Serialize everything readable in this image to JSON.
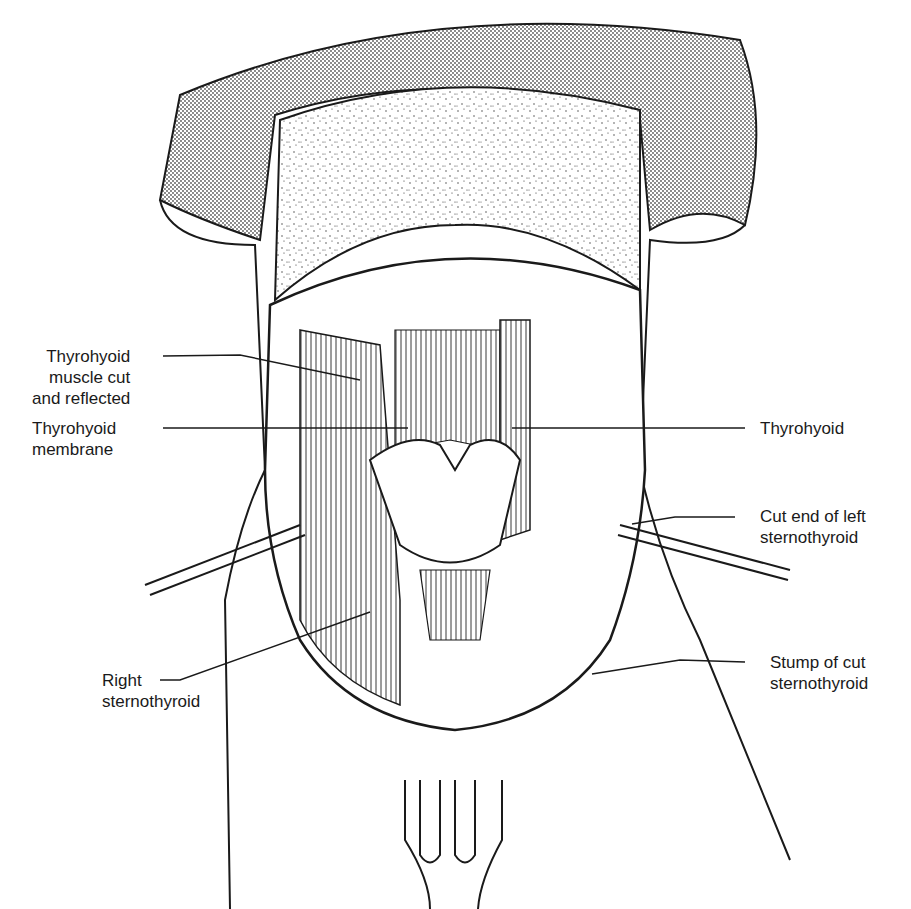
{
  "figure": {
    "ink_color": "#1a1a1a",
    "fill_color": "#ffffff",
    "shade_color": "#bdbdbd"
  },
  "labels": {
    "thyrohyoid_muscle_cut": [
      "Thyrohyoid",
      "muscle cut",
      "and reflected"
    ],
    "thyrohyoid_membrane": [
      "Thyrohyoid",
      "membrane"
    ],
    "thyrohyoid": [
      "Thyrohyoid"
    ],
    "cut_end_left_sternothyroid": [
      "Cut end of left",
      "sternothyroid"
    ],
    "right_sternothyroid": [
      "Right",
      "sternothyroid"
    ],
    "stump_cut_sternothyroid": [
      "Stump of cut",
      "sternothyroid"
    ]
  }
}
